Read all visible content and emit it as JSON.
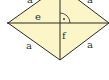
{
  "diagram": {
    "shape": "rhombus",
    "fill_color": "#fbf5c8",
    "stroke_color": "#2a2a2a",
    "labels": {
      "side_top_left": "a",
      "side_top_right": "a",
      "side_bottom_left": "a",
      "side_bottom_right": "a",
      "diagonal_horizontal": "e",
      "diagonal_vertical": "f"
    },
    "right_angle_mark": "·"
  }
}
